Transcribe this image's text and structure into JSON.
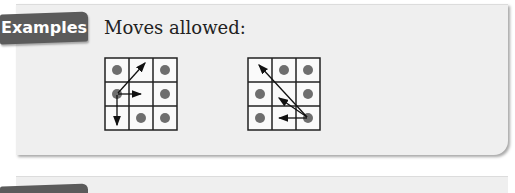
{
  "tab": {
    "label": "Examples"
  },
  "heading": "Moves allowed:",
  "colors": {
    "tab_bg": "#5b5b5b",
    "panel_bg": "#efefef",
    "dot": "#6e6e6e",
    "grid_line": "#222222"
  },
  "diagrams": [
    {
      "name": "left-grid",
      "size": 3,
      "dots": [
        [
          0,
          0
        ],
        [
          2,
          0
        ],
        [
          0,
          1
        ],
        [
          2,
          1
        ],
        [
          1,
          2
        ],
        [
          2,
          2
        ]
      ],
      "start": [
        0,
        1
      ],
      "arrows_to": [
        [
          1,
          0
        ],
        [
          1,
          1
        ],
        [
          0,
          2
        ]
      ]
    },
    {
      "name": "right-grid",
      "size": 3,
      "dots": [
        [
          1,
          0
        ],
        [
          2,
          0
        ],
        [
          0,
          1
        ],
        [
          2,
          1
        ],
        [
          0,
          2
        ],
        [
          2,
          2
        ]
      ],
      "start": [
        2,
        2
      ],
      "arrows_to": [
        [
          0,
          0
        ],
        [
          1,
          1
        ],
        [
          1,
          2
        ]
      ]
    }
  ]
}
